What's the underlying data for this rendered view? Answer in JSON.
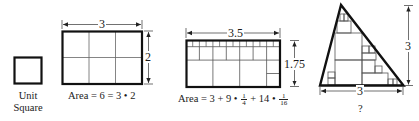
{
  "figure": {
    "stroke_color": "#111111",
    "thin_stroke_color": "#555555",
    "background": "#ffffff"
  },
  "unit_square": {
    "label_line1": "Unit",
    "label_line2": "Square"
  },
  "rect_3x2": {
    "width_label": "3",
    "height_label": "2",
    "area_text": "Area = 6 = 3 • 2",
    "columns": 3,
    "rows": 2
  },
  "rect_35x175": {
    "width_label": "3.5",
    "height_label": "1.75",
    "area_prefix": "Area = 3 + 9 •",
    "frac1_num": "1",
    "frac1_den": "4",
    "area_mid": "+ 14 •",
    "frac2_num": "1",
    "frac2_den": "16",
    "unit_squares": 3,
    "quarter_squares": 9,
    "sixteenth_squares": 14
  },
  "triangle": {
    "base_label": "3",
    "height_label": "3",
    "area_label": "?"
  }
}
